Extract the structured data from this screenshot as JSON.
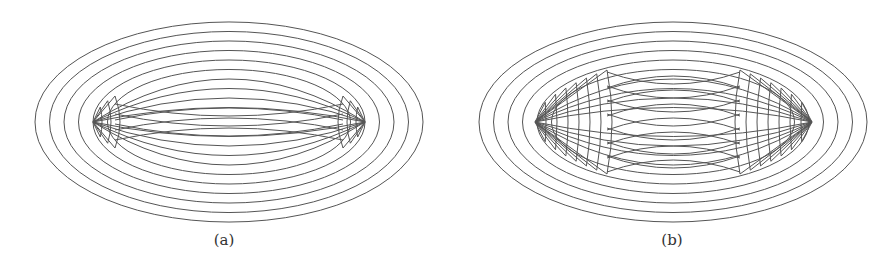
{
  "figure": {
    "panels": [
      {
        "label": "(a)",
        "center": [
          229,
          122
        ],
        "outer_rx": 194,
        "outer_ry": 100,
        "ring_count": 10,
        "ring_step": 9.5,
        "lens_tip_left": 93,
        "lens_tip_right": 365,
        "crossing_band": "narrow",
        "arc_count": 3
      },
      {
        "label": "(b)",
        "center": [
          673,
          122
        ],
        "outer_rx": 194,
        "outer_ry": 100,
        "ring_count": 10,
        "ring_step": 9.5,
        "lens_tip_left": 535,
        "lens_tip_right": 812,
        "crossing_band": "wide",
        "arc_count": 7
      }
    ],
    "stroke_color": "#555555"
  }
}
